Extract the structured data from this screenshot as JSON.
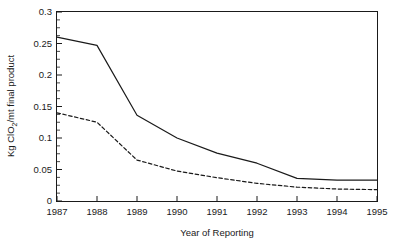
{
  "chart_data": {
    "type": "line",
    "title": "",
    "subtitle": "",
    "xlabel": "Year  of Reporting",
    "ylabel": "Kg ClO2/mt final product",
    "ylabel_parts": {
      "prefix": "Kg ClO",
      "subscript": "2",
      "suffix": "/mt final product"
    },
    "x": [
      1987,
      1988,
      1989,
      1990,
      1991,
      1992,
      1993,
      1994,
      1995
    ],
    "categories": [
      "1987",
      "1988",
      "1989",
      "1990",
      "1991",
      "1992",
      "1993",
      "1994",
      "1995"
    ],
    "xlim": [
      1987,
      1995
    ],
    "ylim": [
      0,
      0.3
    ],
    "ytick_labels": [
      "0",
      "0.05",
      "0.1",
      "0.15",
      "0.2",
      "0.25",
      "0.3"
    ],
    "ytick_values": [
      0,
      0.05,
      0.1,
      0.15,
      0.2,
      0.25,
      0.3
    ],
    "yminor_step": 0.0125,
    "grid": false,
    "legend": "none",
    "series": [
      {
        "name": "solid-series",
        "style": "solid",
        "color": "#1a1a1a",
        "values": [
          0.26,
          0.247,
          0.136,
          0.1,
          0.076,
          0.06,
          0.036,
          0.033,
          0.033
        ]
      },
      {
        "name": "dashed-series",
        "style": "dashed",
        "color": "#1a1a1a",
        "values": [
          0.14,
          0.125,
          0.065,
          0.0475,
          0.037,
          0.028,
          0.022,
          0.019,
          0.018
        ]
      }
    ],
    "annotations": []
  },
  "figure": {
    "axis_color": "#1a1a1a",
    "background": "#ffffff"
  }
}
